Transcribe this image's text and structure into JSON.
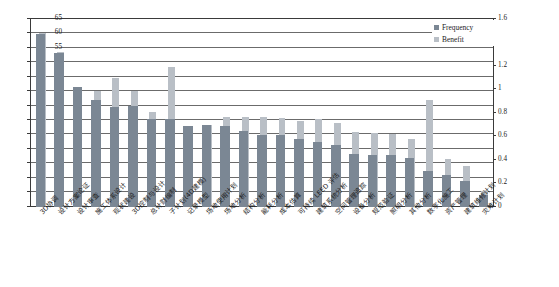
{
  "chart_data": {
    "type": "bar",
    "title": "",
    "subtitle": "",
    "xlabel": "",
    "ylabel": "",
    "y2label": "",
    "grid": true,
    "legend_position": "top-right",
    "ylim": [
      0,
      65
    ],
    "y2lim": [
      0,
      1.6
    ],
    "yticks": [
      "0",
      "5",
      "10",
      "15",
      "20",
      "25",
      "30",
      "35",
      "40",
      "45",
      "50",
      "55",
      "60",
      "65"
    ],
    "y2ticks": [
      "0",
      "0.2",
      "0.4",
      "0.6",
      "0.8",
      "1",
      "1.2",
      "1.4",
      "1.6"
    ],
    "categories": [
      "3D协调",
      "设计方案论证",
      "设计审查",
      "施工体系设计",
      "现状建设",
      "3D控制与设计",
      "总计财编制",
      "子计划(4D建模)",
      "记录模型",
      "场地使用计划",
      "场地分析",
      "结构分析",
      "能耗分析",
      "成本估算",
      "可持续 LEED 评估",
      "建筑系统分析",
      "空间管理追踪",
      "设备分析",
      "规范验证",
      "照明分析",
      "其他分析",
      "数字化施工",
      "资产管理",
      "建筑维修计划",
      "灾难计划"
    ],
    "series": [
      {
        "name": "Frequency",
        "axis": "left",
        "color": "#7b8794",
        "values": [
          60,
          53.5,
          41.5,
          37,
          34.5,
          35,
          30.5,
          30.5,
          28,
          28.5,
          28,
          26.5,
          25,
          25,
          23.5,
          22.5,
          21.5,
          18.5,
          18,
          18,
          17,
          12.5,
          11,
          9,
          4
        ]
      },
      {
        "name": "Benefit",
        "axis": "right",
        "color": "#b9bfc6",
        "values": [
          1.48,
          1.32,
          1.02,
          0.99,
          1.1,
          0.99,
          0.81,
          1.19,
          0.69,
          0.7,
          0.77,
          0.77,
          0.77,
          0.76,
          0.73,
          0.75,
          0.72,
          0.64,
          0.63,
          0.62,
          0.58,
          0.91,
          0.41,
          0.35,
          0.14
        ]
      }
    ]
  },
  "legend": {
    "items": [
      {
        "label": "Frequency",
        "swatch": "freq"
      },
      {
        "label": "Benefit",
        "swatch": "ben"
      }
    ]
  }
}
